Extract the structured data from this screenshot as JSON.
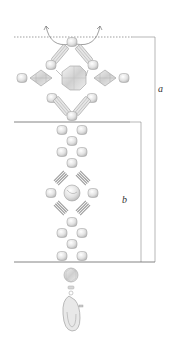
{
  "figure": {
    "type": "beaded pendant / keychain pattern diagram",
    "dimensions": [
      {
        "id": "a",
        "label": "a",
        "from": "top dotted line",
        "to": "bottom line"
      },
      {
        "id": "b",
        "label": "b",
        "from": "middle line",
        "to": "bottom line"
      }
    ],
    "components": {
      "top_motif": "diamond frame of bugle beads and round beads with central faceted crystal, flanked by two bicone beads and round beads",
      "middle_chain": "pairs of round beads with single connector beads",
      "middle_motif": "small diamond of striped bugle beads around central round bead, flanked by round beads",
      "bottom": "faceted round bead, small spacer, lobster clasp"
    },
    "thread_arrows": 2,
    "colors": {
      "line": "#7a7a7a",
      "bead_fill": "#dcdcdc",
      "bead_stroke": "#9a9a9a",
      "text": "#333333"
    }
  }
}
